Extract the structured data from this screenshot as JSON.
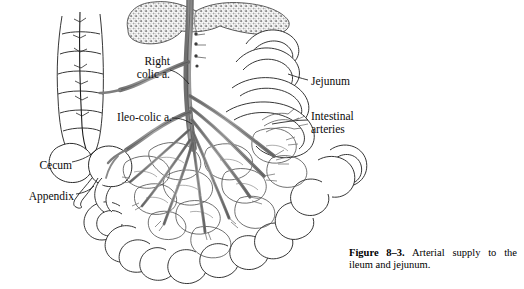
{
  "figure": {
    "caption_label": "Figure 8–3.",
    "caption_text": "Arterial supply to the ileum and jejunum.",
    "background_color": "#ffffff",
    "ink_color": "#1a1a1a",
    "artery_color": "#8f8f8f",
    "artery_outline_color": "#3a3a3a",
    "pancreas_color": "#9a9a9a"
  },
  "labels": {
    "right_colic": "Right\ncolic a.",
    "ileo_colic": "Ileo-colic a.",
    "cecum": "Cecum",
    "appendix": "Appendix",
    "jejunum": "Jejunum",
    "intestinal_arteries": "Intestinal\narteries"
  },
  "structures": [
    {
      "name": "pancreas",
      "description": "stippled gland across top"
    },
    {
      "name": "superior-mesenteric-artery",
      "description": "central descending trunk"
    },
    {
      "name": "right-colic-artery",
      "description": "branch to ascending colon"
    },
    {
      "name": "ileocolic-artery",
      "description": "branch to cecum and ileum"
    },
    {
      "name": "ascending-colon",
      "description": "haustrated colon at left"
    },
    {
      "name": "cecum",
      "description": "blind pouch at colon base"
    },
    {
      "name": "appendix",
      "description": "slender tube off cecum"
    },
    {
      "name": "jejunum",
      "description": "upper small bowel loops at right"
    },
    {
      "name": "ileum",
      "description": "lower small bowel loops"
    },
    {
      "name": "mesenteric-arcades",
      "description": "network of vascular arcades"
    },
    {
      "name": "intestinal-arteries",
      "description": "straight vessels to bowel wall"
    }
  ]
}
